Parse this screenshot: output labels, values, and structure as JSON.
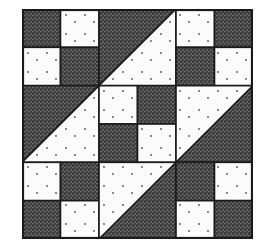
{
  "figure": {
    "type": "quilt-block",
    "grid_units": 6,
    "colors": {
      "background": "#ffffff",
      "dark_fill": "#3a3a3a",
      "dark_speckle": "#d8d8d8",
      "light_fill": "#fbfbfb",
      "light_dot": "#555555",
      "line": "#1a1a1a"
    },
    "patches": [
      {
        "name": "corner-top-left",
        "kind": "four-patch",
        "row": 0,
        "col": 0,
        "cells": [
          "dark",
          "light",
          "light",
          "dark"
        ]
      },
      {
        "name": "edge-top",
        "kind": "half-square-triangle",
        "row": 0,
        "col": 1,
        "diagonal": "bl-tr",
        "upper": "dark",
        "lower": "light"
      },
      {
        "name": "corner-top-right",
        "kind": "four-patch",
        "row": 0,
        "col": 2,
        "cells": [
          "light",
          "dark",
          "dark",
          "light"
        ]
      },
      {
        "name": "edge-left",
        "kind": "half-square-triangle",
        "row": 1,
        "col": 0,
        "diagonal": "bl-tr",
        "upper": "dark",
        "lower": "light"
      },
      {
        "name": "center",
        "kind": "four-patch",
        "row": 1,
        "col": 1,
        "cells": [
          "light",
          "dark",
          "dark",
          "light"
        ]
      },
      {
        "name": "edge-right",
        "kind": "half-square-triangle",
        "row": 1,
        "col": 2,
        "diagonal": "bl-tr",
        "upper": "light",
        "lower": "dark"
      },
      {
        "name": "corner-bottom-left",
        "kind": "four-patch",
        "row": 2,
        "col": 0,
        "cells": [
          "light",
          "dark",
          "dark",
          "light"
        ]
      },
      {
        "name": "edge-bottom",
        "kind": "half-square-triangle",
        "row": 2,
        "col": 1,
        "diagonal": "bl-tr",
        "upper": "light",
        "lower": "dark"
      },
      {
        "name": "corner-bottom-right",
        "kind": "four-patch",
        "row": 2,
        "col": 2,
        "cells": [
          "dark",
          "light",
          "light",
          "dark"
        ]
      }
    ]
  }
}
